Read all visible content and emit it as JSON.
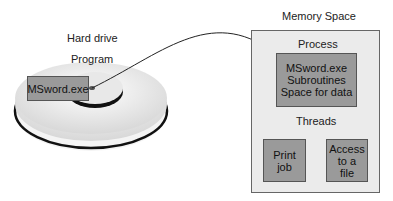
{
  "hard_drive": {
    "label": "Hard drive",
    "program_label": "Program",
    "file_label": "MSword.exe"
  },
  "memory": {
    "title": "Memory Space",
    "process_label": "Process",
    "process_box": {
      "line1": "MSword.exe",
      "line2": "Subroutines",
      "line3": "Space for data"
    },
    "threads_label": "Threads",
    "thread_boxes": [
      {
        "line1": "Print",
        "line2": "job"
      },
      {
        "line1": "Access",
        "line2": "to a",
        "line3": "file"
      }
    ]
  },
  "colors": {
    "box_fill": "#9a9a9a",
    "memory_fill": "#ebebeb",
    "disk_fill": "#f2f2f2"
  }
}
